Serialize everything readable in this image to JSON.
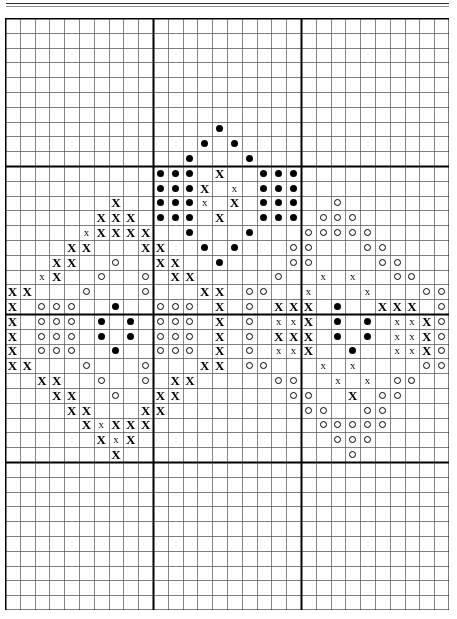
{
  "document": {
    "kind": "cross-stitch-pattern-chart",
    "title": "Cross Stitch Pattern Chart",
    "has_top_rule": true
  },
  "grid": {
    "columns": 30,
    "rows": 40,
    "cell_size_px": 14.8,
    "origin_x_px": 5,
    "origin_y_px": 18,
    "minor_line_color": "#555555",
    "major_line_color": "#000000",
    "minor_line_width_px": 0.7,
    "major_line_width_px": 2.0,
    "major_every": 10,
    "background_color": "#ffffff"
  },
  "legend": {
    "symbols": [
      {
        "key": "dot",
        "glyph": "●",
        "name": "filled-dot-symbol",
        "color": "#000000",
        "description": "solid round dot"
      },
      {
        "key": "x",
        "glyph": "X",
        "name": "cross-x-symbol",
        "color": "#000000",
        "description": "bold X stitch mark"
      },
      {
        "key": "xlight",
        "glyph": "x",
        "name": "light-x-symbol",
        "color": "#111111",
        "description": "light X stitch mark"
      },
      {
        "key": "circle",
        "glyph": "○",
        "name": "open-circle-symbol",
        "color": "#000000",
        "description": "open circle / ring"
      }
    ]
  },
  "chart_data": {
    "type": "heatmap",
    "xlabel": "",
    "ylabel": "",
    "grid": true,
    "legend_position": "none",
    "categories": [
      "dot",
      "x",
      "xlight",
      "circle"
    ],
    "x": [
      0,
      1,
      2,
      3,
      4,
      5,
      6,
      7,
      8,
      9,
      10,
      11,
      12,
      13,
      14,
      15,
      16,
      17,
      18,
      19,
      20,
      21,
      22,
      23,
      24,
      25,
      26,
      27,
      28,
      29
    ],
    "axis_ranges": {
      "xlim": [
        0,
        30
      ],
      "ylim": [
        0,
        40
      ]
    },
    "counts": {
      "dot": 63,
      "x": 93,
      "xlight": 22,
      "circle": 94,
      "total": 272
    },
    "cells": [
      {
        "c": 14,
        "r": 7,
        "s": "dot"
      },
      {
        "c": 13,
        "r": 8,
        "s": "dot"
      },
      {
        "c": 15,
        "r": 8,
        "s": "dot"
      },
      {
        "c": 12,
        "r": 9,
        "s": "dot"
      },
      {
        "c": 16,
        "r": 9,
        "s": "dot"
      },
      {
        "c": 10,
        "r": 10,
        "s": "dot"
      },
      {
        "c": 11,
        "r": 10,
        "s": "dot"
      },
      {
        "c": 12,
        "r": 10,
        "s": "dot"
      },
      {
        "c": 14,
        "r": 10,
        "s": "x"
      },
      {
        "c": 17,
        "r": 10,
        "s": "dot"
      },
      {
        "c": 18,
        "r": 10,
        "s": "dot"
      },
      {
        "c": 19,
        "r": 10,
        "s": "dot"
      },
      {
        "c": 10,
        "r": 11,
        "s": "dot"
      },
      {
        "c": 11,
        "r": 11,
        "s": "dot"
      },
      {
        "c": 12,
        "r": 11,
        "s": "dot"
      },
      {
        "c": 13,
        "r": 11,
        "s": "x"
      },
      {
        "c": 15,
        "r": 11,
        "s": "xlight"
      },
      {
        "c": 17,
        "r": 11,
        "s": "dot"
      },
      {
        "c": 18,
        "r": 11,
        "s": "dot"
      },
      {
        "c": 19,
        "r": 11,
        "s": "dot"
      },
      {
        "c": 7,
        "r": 12,
        "s": "x"
      },
      {
        "c": 10,
        "r": 12,
        "s": "dot"
      },
      {
        "c": 11,
        "r": 12,
        "s": "dot"
      },
      {
        "c": 12,
        "r": 12,
        "s": "dot"
      },
      {
        "c": 13,
        "r": 12,
        "s": "xlight"
      },
      {
        "c": 15,
        "r": 12,
        "s": "x"
      },
      {
        "c": 17,
        "r": 12,
        "s": "dot"
      },
      {
        "c": 18,
        "r": 12,
        "s": "dot"
      },
      {
        "c": 19,
        "r": 12,
        "s": "dot"
      },
      {
        "c": 22,
        "r": 12,
        "s": "circle"
      },
      {
        "c": 6,
        "r": 13,
        "s": "x"
      },
      {
        "c": 7,
        "r": 13,
        "s": "x"
      },
      {
        "c": 8,
        "r": 13,
        "s": "x"
      },
      {
        "c": 10,
        "r": 13,
        "s": "dot"
      },
      {
        "c": 11,
        "r": 13,
        "s": "dot"
      },
      {
        "c": 12,
        "r": 13,
        "s": "dot"
      },
      {
        "c": 14,
        "r": 13,
        "s": "x"
      },
      {
        "c": 17,
        "r": 13,
        "s": "dot"
      },
      {
        "c": 18,
        "r": 13,
        "s": "dot"
      },
      {
        "c": 19,
        "r": 13,
        "s": "dot"
      },
      {
        "c": 21,
        "r": 13,
        "s": "circle"
      },
      {
        "c": 22,
        "r": 13,
        "s": "circle"
      },
      {
        "c": 23,
        "r": 13,
        "s": "circle"
      },
      {
        "c": 5,
        "r": 14,
        "s": "xlight"
      },
      {
        "c": 6,
        "r": 14,
        "s": "x"
      },
      {
        "c": 7,
        "r": 14,
        "s": "x"
      },
      {
        "c": 8,
        "r": 14,
        "s": "x"
      },
      {
        "c": 9,
        "r": 14,
        "s": "x"
      },
      {
        "c": 12,
        "r": 14,
        "s": "dot"
      },
      {
        "c": 16,
        "r": 14,
        "s": "dot"
      },
      {
        "c": 20,
        "r": 14,
        "s": "circle"
      },
      {
        "c": 21,
        "r": 14,
        "s": "circle"
      },
      {
        "c": 22,
        "r": 14,
        "s": "circle"
      },
      {
        "c": 23,
        "r": 14,
        "s": "circle"
      },
      {
        "c": 24,
        "r": 14,
        "s": "circle"
      },
      {
        "c": 4,
        "r": 15,
        "s": "x"
      },
      {
        "c": 5,
        "r": 15,
        "s": "x"
      },
      {
        "c": 9,
        "r": 15,
        "s": "x"
      },
      {
        "c": 10,
        "r": 15,
        "s": "x"
      },
      {
        "c": 13,
        "r": 15,
        "s": "dot"
      },
      {
        "c": 15,
        "r": 15,
        "s": "dot"
      },
      {
        "c": 19,
        "r": 15,
        "s": "circle"
      },
      {
        "c": 20,
        "r": 15,
        "s": "circle"
      },
      {
        "c": 24,
        "r": 15,
        "s": "circle"
      },
      {
        "c": 25,
        "r": 15,
        "s": "circle"
      },
      {
        "c": 3,
        "r": 16,
        "s": "x"
      },
      {
        "c": 4,
        "r": 16,
        "s": "x"
      },
      {
        "c": 7,
        "r": 16,
        "s": "circle"
      },
      {
        "c": 10,
        "r": 16,
        "s": "x"
      },
      {
        "c": 11,
        "r": 16,
        "s": "x"
      },
      {
        "c": 14,
        "r": 16,
        "s": "dot"
      },
      {
        "c": 19,
        "r": 16,
        "s": "circle"
      },
      {
        "c": 20,
        "r": 16,
        "s": "circle"
      },
      {
        "c": 25,
        "r": 16,
        "s": "circle"
      },
      {
        "c": 26,
        "r": 16,
        "s": "circle"
      },
      {
        "c": 2,
        "r": 17,
        "s": "xlight"
      },
      {
        "c": 3,
        "r": 17,
        "s": "x"
      },
      {
        "c": 6,
        "r": 17,
        "s": "circle"
      },
      {
        "c": 9,
        "r": 17,
        "s": "circle"
      },
      {
        "c": 11,
        "r": 17,
        "s": "x"
      },
      {
        "c": 12,
        "r": 17,
        "s": "x"
      },
      {
        "c": 18,
        "r": 17,
        "s": "circle"
      },
      {
        "c": 21,
        "r": 17,
        "s": "xlight"
      },
      {
        "c": 23,
        "r": 17,
        "s": "xlight"
      },
      {
        "c": 26,
        "r": 17,
        "s": "circle"
      },
      {
        "c": 27,
        "r": 17,
        "s": "circle"
      },
      {
        "c": 0,
        "r": 18,
        "s": "x"
      },
      {
        "c": 1,
        "r": 18,
        "s": "x"
      },
      {
        "c": 5,
        "r": 18,
        "s": "circle"
      },
      {
        "c": 9,
        "r": 18,
        "s": "circle"
      },
      {
        "c": 13,
        "r": 18,
        "s": "x"
      },
      {
        "c": 14,
        "r": 18,
        "s": "x"
      },
      {
        "c": 16,
        "r": 18,
        "s": "circle"
      },
      {
        "c": 17,
        "r": 18,
        "s": "circle"
      },
      {
        "c": 20,
        "r": 18,
        "s": "xlight"
      },
      {
        "c": 24,
        "r": 18,
        "s": "xlight"
      },
      {
        "c": 28,
        "r": 18,
        "s": "circle"
      },
      {
        "c": 29,
        "r": 18,
        "s": "circle"
      },
      {
        "c": 0,
        "r": 19,
        "s": "x"
      },
      {
        "c": 2,
        "r": 19,
        "s": "circle"
      },
      {
        "c": 3,
        "r": 19,
        "s": "circle"
      },
      {
        "c": 4,
        "r": 19,
        "s": "circle"
      },
      {
        "c": 7,
        "r": 19,
        "s": "dot"
      },
      {
        "c": 10,
        "r": 19,
        "s": "circle"
      },
      {
        "c": 11,
        "r": 19,
        "s": "circle"
      },
      {
        "c": 12,
        "r": 19,
        "s": "circle"
      },
      {
        "c": 14,
        "r": 19,
        "s": "x"
      },
      {
        "c": 16,
        "r": 19,
        "s": "circle"
      },
      {
        "c": 18,
        "r": 19,
        "s": "x"
      },
      {
        "c": 19,
        "r": 19,
        "s": "x"
      },
      {
        "c": 20,
        "r": 19,
        "s": "x"
      },
      {
        "c": 22,
        "r": 19,
        "s": "dot"
      },
      {
        "c": 25,
        "r": 19,
        "s": "x"
      },
      {
        "c": 26,
        "r": 19,
        "s": "x"
      },
      {
        "c": 27,
        "r": 19,
        "s": "x"
      },
      {
        "c": 29,
        "r": 19,
        "s": "circle"
      },
      {
        "c": 0,
        "r": 20,
        "s": "x"
      },
      {
        "c": 2,
        "r": 20,
        "s": "circle"
      },
      {
        "c": 3,
        "r": 20,
        "s": "circle"
      },
      {
        "c": 4,
        "r": 20,
        "s": "circle"
      },
      {
        "c": 6,
        "r": 20,
        "s": "dot"
      },
      {
        "c": 8,
        "r": 20,
        "s": "dot"
      },
      {
        "c": 10,
        "r": 20,
        "s": "circle"
      },
      {
        "c": 11,
        "r": 20,
        "s": "circle"
      },
      {
        "c": 12,
        "r": 20,
        "s": "circle"
      },
      {
        "c": 14,
        "r": 20,
        "s": "x"
      },
      {
        "c": 16,
        "r": 20,
        "s": "circle"
      },
      {
        "c": 18,
        "r": 20,
        "s": "xlight"
      },
      {
        "c": 19,
        "r": 20,
        "s": "xlight"
      },
      {
        "c": 20,
        "r": 20,
        "s": "x"
      },
      {
        "c": 22,
        "r": 20,
        "s": "dot"
      },
      {
        "c": 24,
        "r": 20,
        "s": "dot"
      },
      {
        "c": 26,
        "r": 20,
        "s": "xlight"
      },
      {
        "c": 27,
        "r": 20,
        "s": "xlight"
      },
      {
        "c": 28,
        "r": 20,
        "s": "x"
      },
      {
        "c": 29,
        "r": 20,
        "s": "circle"
      },
      {
        "c": 0,
        "r": 21,
        "s": "x"
      },
      {
        "c": 2,
        "r": 21,
        "s": "circle"
      },
      {
        "c": 3,
        "r": 21,
        "s": "circle"
      },
      {
        "c": 4,
        "r": 21,
        "s": "circle"
      },
      {
        "c": 6,
        "r": 21,
        "s": "dot"
      },
      {
        "c": 8,
        "r": 21,
        "s": "dot"
      },
      {
        "c": 10,
        "r": 21,
        "s": "circle"
      },
      {
        "c": 11,
        "r": 21,
        "s": "circle"
      },
      {
        "c": 12,
        "r": 21,
        "s": "circle"
      },
      {
        "c": 14,
        "r": 21,
        "s": "x"
      },
      {
        "c": 16,
        "r": 21,
        "s": "circle"
      },
      {
        "c": 18,
        "r": 21,
        "s": "x"
      },
      {
        "c": 19,
        "r": 21,
        "s": "x"
      },
      {
        "c": 20,
        "r": 21,
        "s": "x"
      },
      {
        "c": 22,
        "r": 21,
        "s": "dot"
      },
      {
        "c": 24,
        "r": 21,
        "s": "dot"
      },
      {
        "c": 26,
        "r": 21,
        "s": "xlight"
      },
      {
        "c": 27,
        "r": 21,
        "s": "xlight"
      },
      {
        "c": 28,
        "r": 21,
        "s": "x"
      },
      {
        "c": 29,
        "r": 21,
        "s": "circle"
      },
      {
        "c": 0,
        "r": 22,
        "s": "x"
      },
      {
        "c": 2,
        "r": 22,
        "s": "circle"
      },
      {
        "c": 3,
        "r": 22,
        "s": "circle"
      },
      {
        "c": 4,
        "r": 22,
        "s": "circle"
      },
      {
        "c": 7,
        "r": 22,
        "s": "dot"
      },
      {
        "c": 10,
        "r": 22,
        "s": "circle"
      },
      {
        "c": 11,
        "r": 22,
        "s": "circle"
      },
      {
        "c": 12,
        "r": 22,
        "s": "circle"
      },
      {
        "c": 14,
        "r": 22,
        "s": "x"
      },
      {
        "c": 16,
        "r": 22,
        "s": "circle"
      },
      {
        "c": 18,
        "r": 22,
        "s": "xlight"
      },
      {
        "c": 19,
        "r": 22,
        "s": "xlight"
      },
      {
        "c": 20,
        "r": 22,
        "s": "x"
      },
      {
        "c": 23,
        "r": 22,
        "s": "dot"
      },
      {
        "c": 26,
        "r": 22,
        "s": "xlight"
      },
      {
        "c": 27,
        "r": 22,
        "s": "xlight"
      },
      {
        "c": 28,
        "r": 22,
        "s": "x"
      },
      {
        "c": 29,
        "r": 22,
        "s": "circle"
      },
      {
        "c": 0,
        "r": 23,
        "s": "x"
      },
      {
        "c": 1,
        "r": 23,
        "s": "x"
      },
      {
        "c": 5,
        "r": 23,
        "s": "circle"
      },
      {
        "c": 9,
        "r": 23,
        "s": "circle"
      },
      {
        "c": 13,
        "r": 23,
        "s": "x"
      },
      {
        "c": 14,
        "r": 23,
        "s": "x"
      },
      {
        "c": 16,
        "r": 23,
        "s": "circle"
      },
      {
        "c": 17,
        "r": 23,
        "s": "circle"
      },
      {
        "c": 21,
        "r": 23,
        "s": "xlight"
      },
      {
        "c": 23,
        "r": 23,
        "s": "xlight"
      },
      {
        "c": 28,
        "r": 23,
        "s": "circle"
      },
      {
        "c": 29,
        "r": 23,
        "s": "circle"
      },
      {
        "c": 2,
        "r": 24,
        "s": "x"
      },
      {
        "c": 3,
        "r": 24,
        "s": "x"
      },
      {
        "c": 6,
        "r": 24,
        "s": "circle"
      },
      {
        "c": 9,
        "r": 24,
        "s": "circle"
      },
      {
        "c": 11,
        "r": 24,
        "s": "x"
      },
      {
        "c": 12,
        "r": 24,
        "s": "x"
      },
      {
        "c": 18,
        "r": 24,
        "s": "circle"
      },
      {
        "c": 19,
        "r": 24,
        "s": "circle"
      },
      {
        "c": 22,
        "r": 24,
        "s": "xlight"
      },
      {
        "c": 24,
        "r": 24,
        "s": "xlight"
      },
      {
        "c": 26,
        "r": 24,
        "s": "circle"
      },
      {
        "c": 27,
        "r": 24,
        "s": "circle"
      },
      {
        "c": 3,
        "r": 25,
        "s": "x"
      },
      {
        "c": 4,
        "r": 25,
        "s": "x"
      },
      {
        "c": 7,
        "r": 25,
        "s": "circle"
      },
      {
        "c": 10,
        "r": 25,
        "s": "x"
      },
      {
        "c": 11,
        "r": 25,
        "s": "x"
      },
      {
        "c": 19,
        "r": 25,
        "s": "circle"
      },
      {
        "c": 20,
        "r": 25,
        "s": "circle"
      },
      {
        "c": 23,
        "r": 25,
        "s": "x"
      },
      {
        "c": 25,
        "r": 25,
        "s": "circle"
      },
      {
        "c": 26,
        "r": 25,
        "s": "circle"
      },
      {
        "c": 4,
        "r": 26,
        "s": "x"
      },
      {
        "c": 5,
        "r": 26,
        "s": "x"
      },
      {
        "c": 9,
        "r": 26,
        "s": "x"
      },
      {
        "c": 10,
        "r": 26,
        "s": "x"
      },
      {
        "c": 20,
        "r": 26,
        "s": "circle"
      },
      {
        "c": 21,
        "r": 26,
        "s": "circle"
      },
      {
        "c": 24,
        "r": 26,
        "s": "circle"
      },
      {
        "c": 25,
        "r": 26,
        "s": "circle"
      },
      {
        "c": 5,
        "r": 27,
        "s": "x"
      },
      {
        "c": 6,
        "r": 27,
        "s": "xlight"
      },
      {
        "c": 7,
        "r": 27,
        "s": "x"
      },
      {
        "c": 8,
        "r": 27,
        "s": "x"
      },
      {
        "c": 9,
        "r": 27,
        "s": "x"
      },
      {
        "c": 21,
        "r": 27,
        "s": "circle"
      },
      {
        "c": 22,
        "r": 27,
        "s": "circle"
      },
      {
        "c": 23,
        "r": 27,
        "s": "circle"
      },
      {
        "c": 24,
        "r": 27,
        "s": "circle"
      },
      {
        "c": 25,
        "r": 27,
        "s": "circle"
      },
      {
        "c": 6,
        "r": 28,
        "s": "x"
      },
      {
        "c": 7,
        "r": 28,
        "s": "xlight"
      },
      {
        "c": 8,
        "r": 28,
        "s": "x"
      },
      {
        "c": 22,
        "r": 28,
        "s": "circle"
      },
      {
        "c": 23,
        "r": 28,
        "s": "circle"
      },
      {
        "c": 24,
        "r": 28,
        "s": "circle"
      },
      {
        "c": 7,
        "r": 29,
        "s": "x"
      },
      {
        "c": 23,
        "r": 29,
        "s": "circle"
      }
    ]
  }
}
